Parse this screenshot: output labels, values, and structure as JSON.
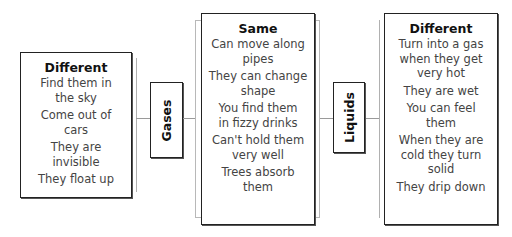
{
  "left": {
    "heading": "Different",
    "items": [
      "Find them in the sky",
      "Come out of cars",
      "They are invisible",
      "They float up"
    ]
  },
  "gases_label": "Gases",
  "center": {
    "heading": "Same",
    "items": [
      "Can move along pipes",
      "They can change shape",
      "You find them in fizzy drinks",
      "Can't hold them very well",
      "Trees absorb them"
    ]
  },
  "liquids_label": "Liquids",
  "right": {
    "heading": "Different",
    "items": [
      "Turn into a gas when they get very hot",
      "They are wet",
      "You can feel them",
      "When they are cold they turn solid",
      "They drip down"
    ]
  }
}
